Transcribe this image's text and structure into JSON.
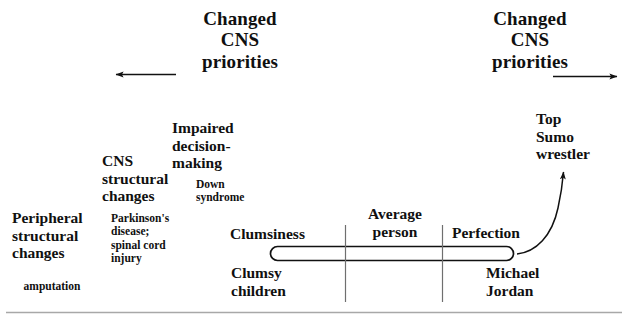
{
  "figure": {
    "stroke_color": "#111111",
    "rule_color": "#a8a8a8",
    "background": "#ffffff"
  },
  "headings": {
    "left": "Changed\nCNS\npriorities",
    "right": "Changed\nCNS\npriorities"
  },
  "arrows": {
    "left_label": "left-pointing-arrow",
    "right_label": "right-pointing-arrow",
    "curved_label": "curved-arrow-to-top-sumo-wrestler"
  },
  "terms": {
    "peripheral": "Peripheral\nstructural\nchanges",
    "cns_structural": "CNS\nstructural\nchanges",
    "impaired": "Impaired\ndecision-\nmaking",
    "clumsiness": "Clumsiness",
    "clumsy_children": "Clumsy\nchildren",
    "average_person": "Average\nperson",
    "perfection": "Perfection",
    "michael_jordan": "Michael\nJordan",
    "top_sumo": "Top\nSumo\nwrestler"
  },
  "examples": {
    "amputation": "amputation",
    "parkinsons": "Parkinson's\ndisease;\nspinal cord\ninjury",
    "down_syndrome": "Down\nsyndrome"
  },
  "scale": {
    "capsule_label": "continuum-capsule-bar",
    "divider_left_label": "tick-divider-clumsiness-average",
    "divider_right_label": "tick-divider-average-perfection"
  }
}
